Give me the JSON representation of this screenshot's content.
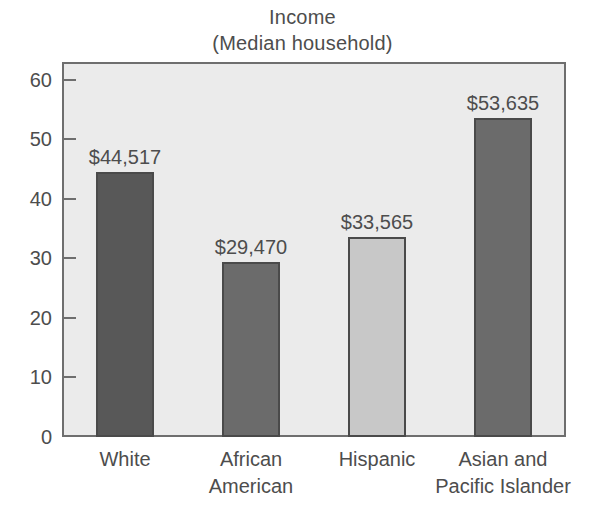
{
  "chart_data": {
    "type": "bar",
    "title": "Income",
    "subtitle": "(Median household)",
    "xlabel": "",
    "ylabel": "",
    "ylim": [
      0,
      63
    ],
    "yticks": [
      0,
      10,
      20,
      30,
      40,
      50,
      60
    ],
    "ytick_labels": [
      "0",
      "10",
      "20",
      "30",
      "40",
      "50",
      "60"
    ],
    "grid": false,
    "legend": "none",
    "units": "thousands of dollars",
    "categories": [
      "White",
      "African American",
      "Hispanic",
      "Asian and Pacific Islander"
    ],
    "category_lines": [
      [
        "White"
      ],
      [
        "African",
        "American"
      ],
      [
        "Hispanic"
      ],
      [
        "Asian and",
        "Pacific Islander"
      ]
    ],
    "values": [
      44.517,
      29.47,
      33.565,
      53.635
    ],
    "data_labels": [
      "$44,517",
      "$29,470",
      "$33,565",
      "$53,635"
    ],
    "bar_colors": [
      "#585858",
      "#6b6b6b",
      "#c8c8c8",
      "#6b6b6b"
    ],
    "bar_edge_color": "#4a4a4a",
    "plot_background": "#ebebeb",
    "axis_color": "#6e6e6e",
    "text_color": "#4d4d4d"
  }
}
